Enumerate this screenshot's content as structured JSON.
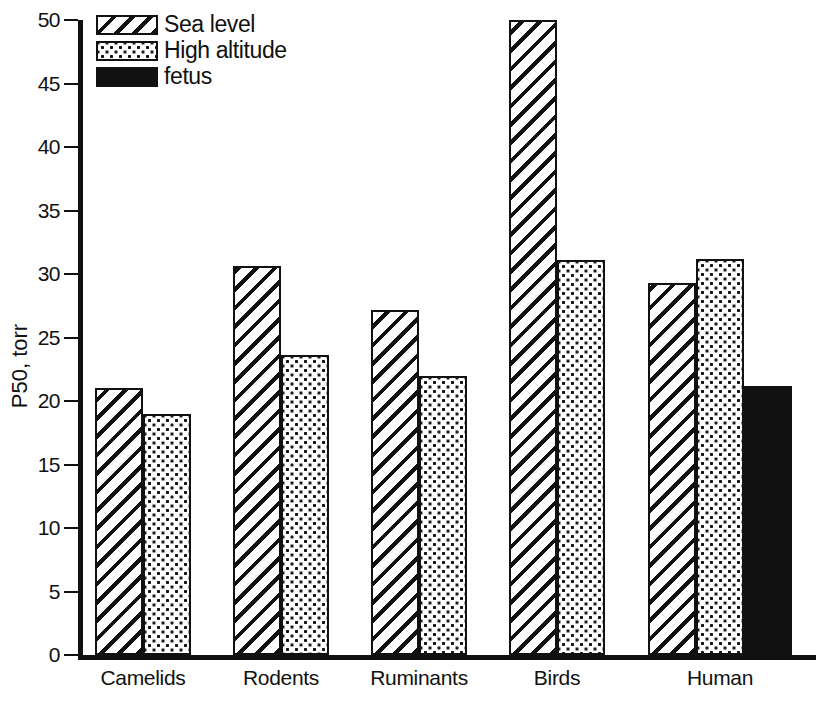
{
  "chart_data": {
    "type": "bar",
    "title": "",
    "xlabel": "",
    "ylabel": "P50, torr",
    "ylim": [
      0,
      50
    ],
    "yticks": [
      0,
      5,
      10,
      15,
      20,
      25,
      30,
      35,
      40,
      45,
      50
    ],
    "grid": false,
    "legend_position": "top-left",
    "categories": [
      "Camelids",
      "Rodents",
      "Ruminants",
      "Birds",
      "Human"
    ],
    "series": [
      {
        "name": "Sea level",
        "pattern": "diagonal-hatch",
        "values": [
          21.0,
          30.6,
          27.2,
          50.0,
          29.3
        ]
      },
      {
        "name": "High altitude",
        "pattern": "dotted",
        "values": [
          19.0,
          23.6,
          22.0,
          31.1,
          31.2
        ]
      },
      {
        "name": "fetus",
        "pattern": "solid-black",
        "values": [
          null,
          null,
          null,
          null,
          21.2
        ]
      }
    ]
  },
  "axis": {
    "y_title": "P50, torr",
    "y_tick_labels": [
      "0",
      "5",
      "10",
      "15",
      "20",
      "25",
      "30",
      "35",
      "40",
      "45",
      "50"
    ],
    "x_tick_labels": [
      "Camelids",
      "Rodents",
      "Ruminants",
      "Birds",
      "Human"
    ]
  },
  "legend": {
    "items": [
      {
        "label": "Sea level"
      },
      {
        "label": "High altitude"
      },
      {
        "label": "fetus"
      }
    ]
  },
  "colors": {
    "ink": "#111111",
    "background": "#ffffff"
  }
}
